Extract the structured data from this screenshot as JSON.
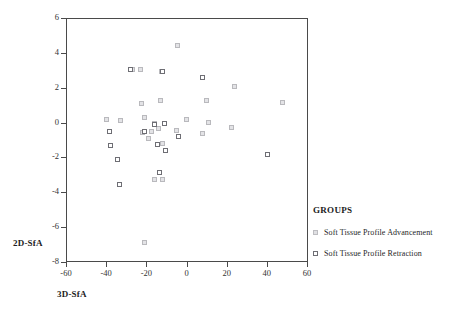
{
  "chart_data": {
    "type": "scatter",
    "title": "",
    "xlabel": "3D-SfA",
    "ylabel": "2D-SfA",
    "xlim": [
      -60,
      60
    ],
    "ylim": [
      -8,
      6
    ],
    "xticks": [
      -60,
      -40,
      -20,
      0,
      20,
      40,
      60
    ],
    "yticks": [
      6,
      4,
      2,
      0,
      -2,
      -4,
      -6,
      -8
    ],
    "xtick_labels": [
      "-60",
      "-40",
      "-20",
      "0",
      "20",
      "40",
      "60"
    ],
    "ytick_labels": [
      "6",
      "4",
      "2",
      "0",
      "-2",
      "-4",
      "-6",
      "-8"
    ],
    "grid": false,
    "legend_position": "right",
    "legend_title": "GROUPS",
    "series": [
      {
        "name": "Soft Tissue Profile Advancement",
        "marker": "open-square",
        "color": "#d9d9dd",
        "points": [
          [
            -40.5,
            0.25
          ],
          [
            -33.5,
            0.2
          ],
          [
            -27.5,
            3.1
          ],
          [
            -23.5,
            3.1
          ],
          [
            -23.0,
            1.15
          ],
          [
            -22.5,
            -0.5
          ],
          [
            -21.5,
            0.35
          ],
          [
            -21.5,
            -6.8
          ],
          [
            -19.5,
            -0.85
          ],
          [
            -18.0,
            -0.45
          ],
          [
            -16.5,
            0.0
          ],
          [
            -16.5,
            -3.2
          ],
          [
            -14.5,
            -0.3
          ],
          [
            -13.5,
            1.3
          ],
          [
            -13.0,
            3.0
          ],
          [
            -12.5,
            -1.15
          ],
          [
            -12.5,
            -3.2
          ],
          [
            -5.0,
            4.5
          ],
          [
            -5.5,
            -0.4
          ],
          [
            -0.5,
            0.25
          ],
          [
            7.5,
            -0.55
          ],
          [
            9.5,
            1.35
          ],
          [
            10.5,
            0.05
          ],
          [
            22.0,
            -0.2
          ],
          [
            23.5,
            2.15
          ],
          [
            47.5,
            1.2
          ]
        ]
      },
      {
        "name": "Soft Tissue Profile Retraction",
        "marker": "open-square",
        "color": "#6e6e74",
        "points": [
          [
            -39.0,
            -0.45
          ],
          [
            -38.5,
            -1.25
          ],
          [
            -35.0,
            -2.05
          ],
          [
            -34.0,
            -3.5
          ],
          [
            -28.5,
            3.1
          ],
          [
            -21.5,
            -0.45
          ],
          [
            -16.5,
            -0.05
          ],
          [
            -15.0,
            -1.2
          ],
          [
            -14.0,
            -2.8
          ],
          [
            -12.5,
            3.0
          ],
          [
            -11.5,
            0.0
          ],
          [
            -11.0,
            -1.55
          ],
          [
            -4.5,
            -0.75
          ],
          [
            7.5,
            2.65
          ],
          [
            40.0,
            -1.75
          ]
        ]
      }
    ]
  },
  "axes": {
    "y_title": "2D-SfA",
    "x_title": "3D-SfA"
  },
  "legend": {
    "title": "GROUPS",
    "items": [
      {
        "label": "Soft Tissue Profile Advancement",
        "swatch": "advancement-swatch"
      },
      {
        "label": "Soft Tissue Profile Retraction",
        "swatch": "retraction-swatch"
      }
    ]
  }
}
